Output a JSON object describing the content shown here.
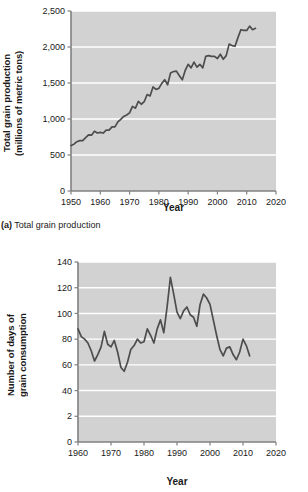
{
  "figure": {
    "caption_a_prefix": "(a)",
    "caption_a_text": " Total grain production"
  },
  "panel_a": {
    "ylabel": "Total grain production\n(millions of metric tons)",
    "xlabel": "Year",
    "ytick_labels": [
      "0",
      "500",
      "1,000",
      "1,500",
      "2,000",
      "2,500"
    ],
    "xtick_labels": [
      "1950",
      "1960",
      "1970",
      "1980",
      "1990",
      "2000",
      "2010",
      "2020"
    ]
  },
  "panel_b": {
    "ylabel": "Number of days of\ngrain consumption",
    "xlabel": "Year",
    "ytick_labels": [
      "0",
      "2",
      "40",
      "60",
      "80",
      "100",
      "120",
      "140"
    ],
    "xtick_labels": [
      "1960",
      "1970",
      "1980",
      "1990",
      "2000",
      "2010",
      "2020"
    ]
  },
  "colors": {
    "plot_background": "#d2d2d2",
    "gridline": "#ffffff",
    "line": "#4d4d4d",
    "axis": "#808080",
    "text": "#1a1a1a"
  },
  "chart_data": [
    {
      "type": "line",
      "title": "(a) Total grain production",
      "xlabel": "Year",
      "ylabel": "Total grain production (millions of metric tons)",
      "xlim": [
        1950,
        2020
      ],
      "ylim": [
        0,
        2500
      ],
      "yticks": [
        0,
        500,
        1000,
        1500,
        2000,
        2500
      ],
      "xticks": [
        1950,
        1960,
        1970,
        1980,
        1990,
        2000,
        2010,
        2020
      ],
      "grid": true,
      "legend": "none",
      "x": [
        1950,
        1951,
        1952,
        1953,
        1954,
        1955,
        1956,
        1957,
        1958,
        1959,
        1960,
        1961,
        1962,
        1963,
        1964,
        1965,
        1966,
        1967,
        1968,
        1969,
        1970,
        1971,
        1972,
        1973,
        1974,
        1975,
        1976,
        1977,
        1978,
        1979,
        1980,
        1981,
        1982,
        1983,
        1984,
        1985,
        1986,
        1987,
        1988,
        1989,
        1990,
        1991,
        1992,
        1993,
        1994,
        1995,
        1996,
        1997,
        1998,
        1999,
        2000,
        2001,
        2002,
        2003,
        2004,
        2005,
        2006,
        2007,
        2008,
        2009,
        2010,
        2011,
        2012,
        2013
      ],
      "values": [
        631,
        650,
        685,
        700,
        700,
        740,
        780,
        775,
        830,
        805,
        815,
        805,
        845,
        845,
        890,
        890,
        960,
        995,
        1035,
        1055,
        1085,
        1175,
        1150,
        1245,
        1205,
        1240,
        1340,
        1320,
        1445,
        1410,
        1425,
        1495,
        1545,
        1475,
        1640,
        1660,
        1665,
        1600,
        1545,
        1675,
        1760,
        1710,
        1790,
        1720,
        1760,
        1710,
        1870,
        1880,
        1870,
        1870,
        1840,
        1900,
        1830,
        1880,
        2040,
        2020,
        2010,
        2130,
        2240,
        2230,
        2230,
        2290,
        2240,
        2260
      ]
    },
    {
      "type": "line",
      "xlabel": "Year",
      "ylabel": "Number of days of grain consumption",
      "xlim": [
        1960,
        2020
      ],
      "ylim": [
        0,
        140
      ],
      "yticks": [
        0,
        20,
        40,
        60,
        80,
        100,
        120,
        140
      ],
      "ytick_labels_shown": [
        "0",
        "2",
        "40",
        "60",
        "80",
        "100",
        "120",
        "140"
      ],
      "xticks": [
        1960,
        1970,
        1980,
        1990,
        2000,
        2010,
        2020
      ],
      "grid": true,
      "legend": "none",
      "x": [
        1960,
        1961,
        1962,
        1963,
        1964,
        1965,
        1966,
        1967,
        1968,
        1969,
        1970,
        1971,
        1972,
        1973,
        1974,
        1975,
        1976,
        1977,
        1978,
        1979,
        1980,
        1981,
        1982,
        1983,
        1984,
        1985,
        1986,
        1987,
        1988,
        1989,
        1990,
        1991,
        1992,
        1993,
        1994,
        1995,
        1996,
        1997,
        1998,
        1999,
        2000,
        2001,
        2002,
        2003,
        2004,
        2005,
        2006,
        2007,
        2008,
        2009,
        2010,
        2011,
        2012
      ],
      "values": [
        88,
        82,
        80,
        77,
        71,
        63,
        68,
        74,
        86,
        76,
        74,
        79,
        70,
        58,
        55,
        62,
        72,
        75,
        80,
        77,
        78,
        88,
        83,
        77,
        88,
        95,
        85,
        105,
        128,
        115,
        101,
        96,
        102,
        105,
        99,
        97,
        90,
        107,
        115,
        112,
        107,
        95,
        83,
        72,
        67,
        73,
        74,
        68,
        64,
        70,
        80,
        75,
        67
      ]
    }
  ]
}
